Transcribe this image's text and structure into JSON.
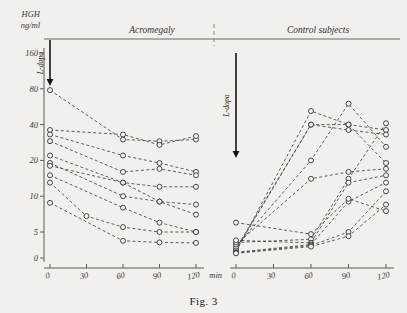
{
  "caption": "Fig. 3",
  "axes": {
    "y_title_line1": "HGH",
    "y_title_line2": "ng/ml",
    "y_ticks": [
      160,
      80,
      40,
      20,
      10,
      5,
      0
    ],
    "y_tick_labels": [
      "160",
      "80",
      "40",
      "20",
      "10",
      "5",
      "0"
    ],
    "x_ticks": [
      0,
      30,
      60,
      90,
      120
    ],
    "x_tick_labels": [
      "0",
      "30",
      "60",
      "90",
      "120"
    ],
    "x_unit_label": "min",
    "scale": "log"
  },
  "panels": {
    "left": {
      "title": "Acromegaly",
      "dose_label": "L-dopa"
    },
    "right": {
      "title": "Control subjects",
      "dose_label": "L-dopa"
    }
  },
  "chart_data": {
    "type": "line",
    "title": "Fig. 3",
    "subtitle": "Serum HGH response to L-dopa in acromegalic and control subjects",
    "xlabel": "min",
    "ylabel": "HGH ng/ml",
    "yscale": "log",
    "ylim": [
      0,
      160
    ],
    "xlim": [
      0,
      120
    ],
    "ytick_values": [
      0,
      5,
      10,
      20,
      40,
      80,
      160
    ],
    "xtick_values": [
      0,
      30,
      60,
      90,
      120
    ],
    "grid": false,
    "legend": "none",
    "marker": "open-circle",
    "linestyle": "dashed",
    "annotations": [
      {
        "text": "L-dopa",
        "panel": "left",
        "x": 0,
        "type": "arrow-down"
      },
      {
        "text": "L-dopa",
        "panel": "right",
        "x": 0,
        "type": "arrow-down"
      }
    ],
    "panels": [
      {
        "name": "Acromegaly",
        "x": [
          0,
          30,
          60,
          90,
          120
        ],
        "series": [
          {
            "name": "A1",
            "x": [
              0,
              30,
              60,
              90,
              120
            ],
            "values": [
              78,
              null,
              30,
              29,
              30
            ]
          },
          {
            "name": "A2",
            "x": [
              0,
              60,
              90,
              120
            ],
            "values": [
              36,
              33,
              27,
              32
            ]
          },
          {
            "name": "A3",
            "x": [
              0,
              60,
              90,
              120
            ],
            "values": [
              33,
              22,
              19,
              16
            ]
          },
          {
            "name": "A4",
            "x": [
              0,
              60,
              90,
              120
            ],
            "values": [
              29,
              16,
              17,
              15
            ]
          },
          {
            "name": "A5",
            "x": [
              0,
              60,
              90,
              120
            ],
            "values": [
              22,
              13,
              12,
              12
            ]
          },
          {
            "name": "A6",
            "x": [
              0,
              60,
              90,
              120
            ],
            "values": [
              19,
              10,
              9,
              8.5
            ]
          },
          {
            "name": "A7",
            "x": [
              0,
              60,
              90,
              120
            ],
            "values": [
              18,
              13,
              9,
              7
            ]
          },
          {
            "name": "A8",
            "x": [
              0,
              60,
              90,
              120
            ],
            "values": [
              15,
              8,
              6,
              5
            ]
          },
          {
            "name": "A9",
            "x": [
              0,
              30,
              60,
              90,
              120
            ],
            "values": [
              13,
              6.8,
              5.5,
              5,
              5
            ]
          },
          {
            "name": "A10",
            "x": [
              0,
              60,
              90,
              120
            ],
            "values": [
              8.8,
              3.3,
              3,
              2.9
            ]
          }
        ]
      },
      {
        "name": "Control subjects",
        "x": [
          0,
          60,
          90,
          120
        ],
        "series": [
          {
            "name": "C1",
            "x": [
              0,
              60,
              90,
              120
            ],
            "values": [
              1.2,
              52,
              40,
              19
            ]
          },
          {
            "name": "C2",
            "x": [
              0,
              60,
              90,
              120
            ],
            "values": [
              1.5,
              40,
              40,
              36
            ]
          },
          {
            "name": "C3",
            "x": [
              0,
              60,
              90,
              120
            ],
            "values": [
              1.8,
              40,
              36,
              33
            ]
          },
          {
            "name": "C4",
            "x": [
              0,
              60,
              90,
              120
            ],
            "values": [
              2.2,
              20,
              60,
              26
            ]
          },
          {
            "name": "C5",
            "x": [
              0,
              60,
              90,
              120
            ],
            "values": [
              2.6,
              14,
              16,
              17
            ]
          },
          {
            "name": "C6",
            "x": [
              0,
              60,
              90,
              120
            ],
            "values": [
              3.0,
              3.6,
              14,
              41
            ]
          },
          {
            "name": "C7",
            "x": [
              0,
              60,
              90,
              120
            ],
            "values": [
              3.4,
              2.9,
              13,
              15
            ]
          },
          {
            "name": "C8",
            "x": [
              0,
              60,
              90,
              120
            ],
            "values": [
              1.1,
              2.6,
              9,
              13
            ]
          },
          {
            "name": "C9",
            "x": [
              0,
              60,
              90,
              120
            ],
            "values": [
              1.0,
              2.4,
              5,
              11
            ]
          },
          {
            "name": "C10",
            "x": [
              0,
              60,
              90,
              120
            ],
            "values": [
              0.9,
              2.2,
              4.2,
              8.5
            ]
          },
          {
            "name": "C11",
            "x": [
              0,
              60,
              90,
              120
            ],
            "values": [
              6.0,
              4.6,
              9.5,
              7.5
            ]
          }
        ]
      }
    ]
  }
}
